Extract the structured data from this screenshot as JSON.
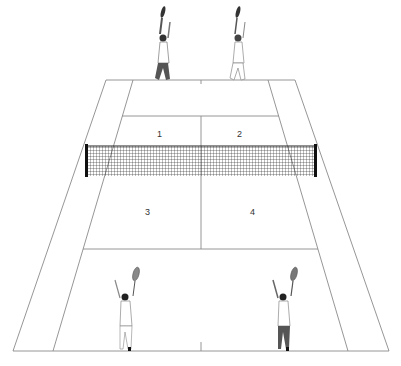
{
  "colors": {
    "background": "#ffffff",
    "court_line": "#8a8a8a",
    "net": "#222222",
    "player_dark": "#555555",
    "player_light": "#ffffff"
  },
  "court": {
    "top_baseline_y": 80,
    "bottom_baseline_y": 351,
    "top_service_y": 116,
    "bottom_service_y": 249,
    "net_y_top": 145,
    "net_y_bottom": 176
  },
  "service_boxes": [
    {
      "label": "1",
      "x": 160,
      "y": 136
    },
    {
      "label": "2",
      "x": 240,
      "y": 136
    },
    {
      "label": "3",
      "x": 148,
      "y": 214
    },
    {
      "label": "4",
      "x": 253,
      "y": 214
    }
  ],
  "players": [
    {
      "name": "far-left-player",
      "position": "top-left",
      "x": 163,
      "y": 8
    },
    {
      "name": "far-right-player",
      "position": "top-right",
      "x": 238,
      "y": 8
    },
    {
      "name": "near-left-player",
      "position": "bottom-left",
      "x": 124,
      "y": 268
    },
    {
      "name": "near-right-player",
      "position": "bottom-right",
      "x": 282,
      "y": 268
    }
  ]
}
